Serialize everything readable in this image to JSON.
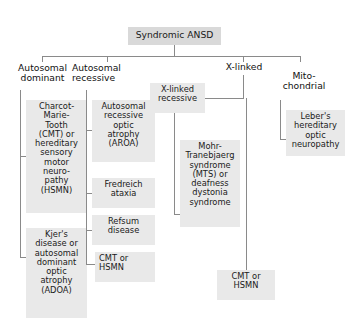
{
  "diagram": {
    "type": "tree-flowchart",
    "root": {
      "label": "Syndromic ANSD"
    },
    "branches": [
      {
        "label": "Autosomal\ndominant"
      },
      {
        "label": "Autosomal\nrecessive"
      },
      {
        "label": "X-linked"
      },
      {
        "label": "Mito-\nchondrial"
      }
    ],
    "nodes": {
      "autosomal_dominant": [
        {
          "label": "Charcot-\nMarie-\nTooth\n(CMT) or\nhereditary\nsensory\nmotor\nneuro-\npathy\n(HSMN)"
        },
        {
          "label": "Kjer's\ndisease or\nautosomal\ndominant\noptic\natrophy\n(ADOA)"
        }
      ],
      "autosomal_recessive": [
        {
          "label": "Autosomal\nrecessive\noptic\natrophy\n(AROA)"
        },
        {
          "label": "Fredreich\nataxia"
        },
        {
          "label": "Refsum\ndisease"
        },
        {
          "label": "CMT or\nHSMN"
        }
      ],
      "x_linked": [
        {
          "label": "X-linked\nrecessive"
        },
        {
          "label": "Mohr-\nTranebjaerg\nsyndrome\n(MTS) or\ndeafness\ndystonia\nsyndrome"
        },
        {
          "label": "CMT or\nHSMN"
        }
      ],
      "mitochondrial": [
        {
          "label": "Leber's\nhereditary\noptic\nneuropathy"
        }
      ]
    },
    "colors": {
      "title_box_fill": "#d9d9d9",
      "box_fill": "#e9e9e9",
      "connector": "#8a8a8a",
      "text": "#1a1a1a",
      "background": "#ffffff"
    }
  }
}
